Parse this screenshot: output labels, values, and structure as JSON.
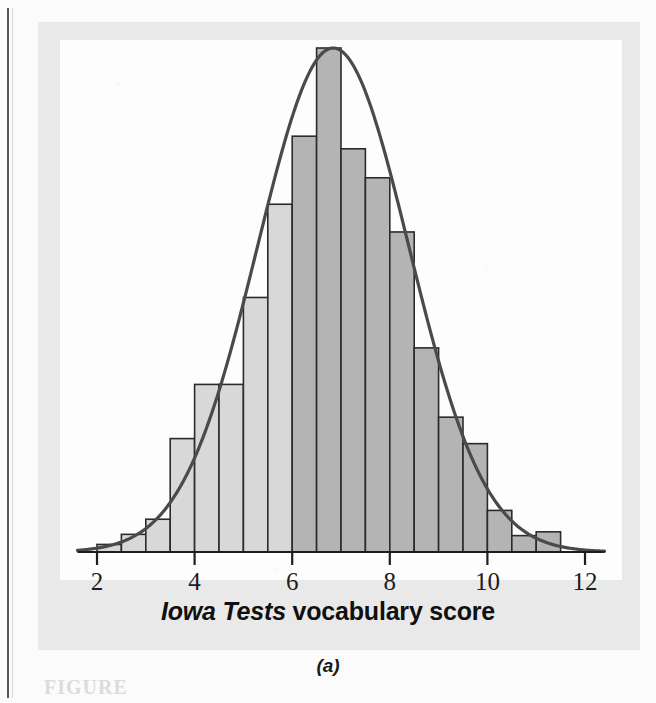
{
  "figure": {
    "panel_letter": "(a)",
    "caption_partial": "FIGURE",
    "colors": {
      "bar_light": "#d8d8d8",
      "bar_dark": "#b4b4b4",
      "bar_outline": "#2b2b2b",
      "curve": "#4a4a4a",
      "axis": "#1d1d1d",
      "panel_background": "#e9e9e9",
      "plot_background": "#fdfdfd"
    }
  },
  "chart_data": {
    "type": "bar",
    "title": "",
    "subtitle": "",
    "xlabel": "Iowa Tests vocabulary score",
    "xlabel_italic_part": "Iowa Tests",
    "xlabel_roman_part": "vocabulary score",
    "ylabel": "",
    "xlim": [
      1.6,
      12.4
    ],
    "ylim": [
      0,
      0.4
    ],
    "grid": false,
    "legend": null,
    "bin_width": 0.5,
    "tick_labels": [
      "2",
      "4",
      "6",
      "8",
      "10",
      "12"
    ],
    "ticks": [
      2,
      4,
      6,
      8,
      10,
      12
    ],
    "shading_split_at": 6.0,
    "bin_starts": [
      2.0,
      2.5,
      3.0,
      3.5,
      4.0,
      4.5,
      5.0,
      5.5,
      6.0,
      6.5,
      7.0,
      7.5,
      8.0,
      8.5,
      9.0,
      9.5,
      10.0,
      10.5,
      11.0
    ],
    "bin_ends": [
      2.5,
      3.0,
      3.5,
      4.0,
      4.5,
      5.0,
      5.5,
      6.0,
      6.5,
      7.0,
      7.5,
      8.0,
      8.5,
      9.0,
      9.5,
      10.0,
      10.5,
      11.0,
      11.5
    ],
    "categories": [
      "2.0-2.5",
      "2.5-3.0",
      "3.0-3.5",
      "3.5-4.0",
      "4.0-4.5",
      "4.5-5.0",
      "5.0-5.5",
      "5.5-6.0",
      "6.0-6.5",
      "6.5-7.0",
      "7.0-7.5",
      "7.5-8.0",
      "8.0-8.5",
      "8.5-9.0",
      "9.0-9.5",
      "9.5-10.0",
      "10.0-10.5",
      "10.5-11.0",
      "11.0-11.5"
    ],
    "values": [
      0.006,
      0.014,
      0.026,
      0.09,
      0.133,
      0.133,
      0.202,
      0.276,
      0.33,
      0.4,
      0.32,
      0.297,
      0.254,
      0.162,
      0.107,
      0.086,
      0.033,
      0.013,
      0.016
    ],
    "bar_shades": [
      "light",
      "light",
      "light",
      "light",
      "light",
      "light",
      "light",
      "light",
      "dark",
      "dark",
      "dark",
      "dark",
      "dark",
      "dark",
      "dark",
      "dark",
      "dark",
      "dark",
      "dark"
    ],
    "curve": {
      "name": "normal density overlay",
      "type": "line",
      "mean": 6.84,
      "sd": 1.55,
      "peak_value": 0.4
    }
  }
}
